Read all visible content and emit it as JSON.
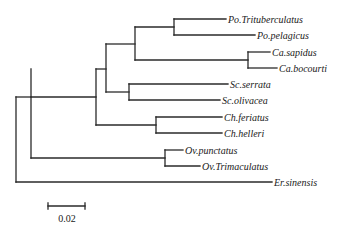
{
  "figure": {
    "type": "phylogenetic-tree",
    "line_color": "#2a2a2a",
    "background": "#ffffff"
  },
  "taxa": [
    {
      "id": "po_tri",
      "label": "Po.Trituberculatus",
      "italic": true
    },
    {
      "id": "po_pel",
      "label": "Po.pelagicus",
      "italic": true
    },
    {
      "id": "ca_sap",
      "label": "Ca.sapidus",
      "italic": true
    },
    {
      "id": "ca_boc",
      "label": "Ca.bocourti",
      "italic": false
    },
    {
      "id": "sc_ser",
      "label": "Sc.serrata",
      "italic": true
    },
    {
      "id": "sc_oli",
      "label": "Sc.olivacea",
      "italic": true
    },
    {
      "id": "ch_fer",
      "label": "Ch.feriatus",
      "italic": true
    },
    {
      "id": "ch_hel",
      "label": "Ch.helleri",
      "italic": true
    },
    {
      "id": "ov_pun",
      "label": "Ov.punctatus",
      "italic": true
    },
    {
      "id": "ov_tri",
      "label": "Ov.Trimaculatus",
      "italic": true
    },
    {
      "id": "er_sin",
      "label": "Er.sinensis",
      "italic": true
    }
  ],
  "topology": "((((((Po.Trituberculatus,Po.pelagicus),(Ca.sapidus,Ca.bocourti)),(Sc.serrata,Sc.olivacea)),(Ch.feriatus,Ch.helleri)),(Ov.punctatus,Ov.Trimaculatus)),Er.sinensis)",
  "scale_bar": {
    "label": "0.02",
    "value": 0.02
  },
  "layout": {
    "nodes": {
      "root": {
        "x": 16,
        "y1": 97,
        "y2": 182
      },
      "n1": {
        "x": 31,
        "y1": 69,
        "y2": 158,
        "attach_y": 97
      },
      "n2": {
        "x": 96,
        "y1": 69,
        "y2": 125,
        "attach_y": 97
      },
      "n3": {
        "x": 106,
        "y1": 44,
        "y2": 92,
        "attach_y": 69
      },
      "n4": {
        "x": 135,
        "y1": 27,
        "y2": 60,
        "attach_y": 44
      },
      "po": {
        "x": 174,
        "y1": 19,
        "y2": 35,
        "attach_y": 27
      },
      "ca": {
        "x": 248,
        "y1": 52,
        "y2": 68,
        "attach_y": 60
      },
      "sc": {
        "x": 129,
        "y1": 84,
        "y2": 100,
        "attach_y": 92
      },
      "ch": {
        "x": 156,
        "y1": 117,
        "y2": 133,
        "attach_y": 125
      },
      "ov": {
        "x": 165,
        "y1": 150,
        "y2": 166,
        "attach_y": 158
      }
    },
    "leaves": {
      "po_tri": {
        "x_start": 174,
        "x_end": 226,
        "y": 19
      },
      "po_pel": {
        "x_start": 174,
        "x_end": 255,
        "y": 35
      },
      "ca_sap": {
        "x_start": 248,
        "x_end": 270,
        "y": 52
      },
      "ca_boc": {
        "x_start": 248,
        "x_end": 277,
        "y": 68
      },
      "sc_ser": {
        "x_start": 129,
        "x_end": 228,
        "y": 84
      },
      "sc_oli": {
        "x_start": 129,
        "x_end": 220,
        "y": 100
      },
      "ch_fer": {
        "x_start": 156,
        "x_end": 222,
        "y": 117
      },
      "ch_hel": {
        "x_start": 156,
        "x_end": 222,
        "y": 133
      },
      "ov_pun": {
        "x_start": 165,
        "x_end": 183,
        "y": 150
      },
      "ov_tri": {
        "x_start": 165,
        "x_end": 200,
        "y": 166
      },
      "er_sin": {
        "x_start": 16,
        "x_end": 272,
        "y": 182
      }
    },
    "scale_bar": {
      "x1": 48,
      "x2": 85,
      "y": 206,
      "label_x": 67,
      "label_y": 222
    }
  }
}
